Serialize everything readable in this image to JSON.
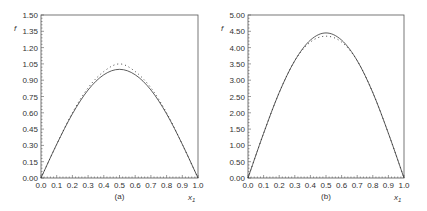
{
  "chart_data": [
    {
      "type": "line",
      "panel_label": "(a)",
      "title": "",
      "xlabel": "x1",
      "ylabel": "f",
      "xlim": [
        0.0,
        1.0
      ],
      "ylim": [
        0.0,
        1.5
      ],
      "xticks": [
        "0.0",
        "0.1",
        "0.2",
        "0.3",
        "0.4",
        "0.5",
        "0.6",
        "0.7",
        "0.8",
        "0.9",
        "1.0"
      ],
      "yticks": [
        "0.00",
        "0.15",
        "0.30",
        "0.45",
        "0.60",
        "0.75",
        "0.90",
        "1.05",
        "1.20",
        "1.35",
        "1.50"
      ],
      "grid": false,
      "legend": null,
      "series": [
        {
          "name": "solid",
          "style": "solid",
          "x": [
            0.0,
            0.1,
            0.2,
            0.3,
            0.4,
            0.5,
            0.6,
            0.7,
            0.8,
            0.9,
            1.0
          ],
          "y": [
            0.0,
            0.31,
            0.59,
            0.81,
            0.95,
            1.0,
            0.95,
            0.81,
            0.59,
            0.31,
            0.0
          ]
        },
        {
          "name": "dotted",
          "style": "dotted",
          "x": [
            0.0,
            0.1,
            0.2,
            0.3,
            0.4,
            0.5,
            0.6,
            0.7,
            0.8,
            0.9,
            1.0
          ],
          "y": [
            0.0,
            0.31,
            0.6,
            0.83,
            0.98,
            1.05,
            0.98,
            0.83,
            0.6,
            0.31,
            0.0
          ]
        }
      ]
    },
    {
      "type": "line",
      "panel_label": "(b)",
      "title": "",
      "xlabel": "x1",
      "ylabel": "f",
      "xlim": [
        0.0,
        1.0
      ],
      "ylim": [
        0.0,
        5.0
      ],
      "xticks": [
        "0.0",
        "0.1",
        "0.2",
        "0.3",
        "0.4",
        "0.5",
        "0.6",
        "0.7",
        "0.8",
        "0.9",
        "1.0"
      ],
      "yticks": [
        "0.00",
        "0.50",
        "1.00",
        "1.50",
        "2.00",
        "2.50",
        "3.00",
        "3.50",
        "4.00",
        "4.50",
        "5.00"
      ],
      "grid": false,
      "legend": null,
      "series": [
        {
          "name": "solid",
          "style": "solid",
          "x": [
            0.0,
            0.1,
            0.2,
            0.3,
            0.4,
            0.5,
            0.6,
            0.7,
            0.8,
            0.9,
            1.0
          ],
          "y": [
            0.0,
            1.37,
            2.62,
            3.6,
            4.23,
            4.45,
            4.23,
            3.6,
            2.62,
            1.37,
            0.0
          ]
        },
        {
          "name": "dotted",
          "style": "dotted",
          "x": [
            0.0,
            0.1,
            0.2,
            0.3,
            0.4,
            0.5,
            0.6,
            0.7,
            0.8,
            0.9,
            1.0
          ],
          "y": [
            0.0,
            1.37,
            2.62,
            3.6,
            4.17,
            4.35,
            4.17,
            3.6,
            2.62,
            1.37,
            0.0
          ]
        }
      ]
    }
  ]
}
